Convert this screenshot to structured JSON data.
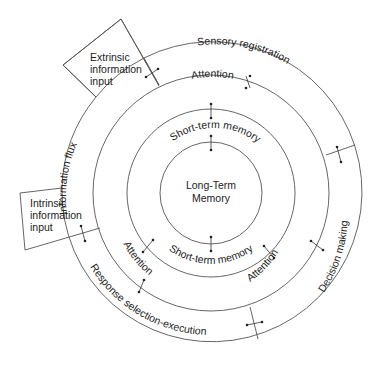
{
  "diagram": {
    "type": "concentric-rings",
    "center_labels": [
      "Long-Term",
      "Memory"
    ],
    "rings": [
      {
        "name": "long-term-memory",
        "label": "Long-Term Memory"
      },
      {
        "name": "short-term-memory",
        "labels": [
          "Short-term memory",
          "Short-term memory"
        ]
      },
      {
        "name": "attention",
        "labels": [
          "Attention",
          "Attention",
          "Attention"
        ]
      },
      {
        "name": "outer-processes",
        "labels": [
          "Sensory registration",
          "Decision making",
          "Response selection-execution",
          "Information flux"
        ]
      }
    ],
    "inputs": {
      "extrinsic": [
        "Extrinsic",
        "information",
        "input"
      ],
      "intrinsic": [
        "Intrinsic",
        "information",
        "input"
      ]
    },
    "labels": {
      "sensory_registration": "Sensory registration",
      "decision_making": "Decision making",
      "response_selection": "Response selection-execution",
      "information_flux": "Information flux",
      "attention_top": "Attention",
      "attention_left": "Attention",
      "attention_right": "Attention",
      "stm_top": "Short-term memory",
      "stm_bottom": "Short-term memory"
    }
  }
}
